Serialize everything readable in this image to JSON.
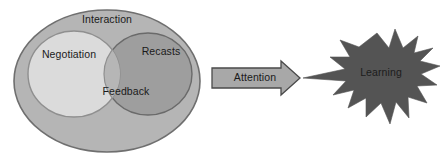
{
  "diagram": {
    "background_color": "#ffffff",
    "outer_set": {
      "label": "Interaction",
      "fill_color": "#b5b5b5",
      "stroke_color": "#6f6f6f"
    },
    "left_set": {
      "label": "Negotiation",
      "fill_color": "#dcdcdc",
      "stroke_color": "#8f8f8f"
    },
    "right_set": {
      "label": "Recasts",
      "fill_color": "#9e9e9e",
      "stroke_color": "#6a6a6a"
    },
    "overlap": {
      "label": "Feedback",
      "fill_color": "#b0b0b0"
    },
    "connector": {
      "label": "Attention",
      "fill_color": "#a8a8a8",
      "stroke_color": "#4a4a4a"
    },
    "outcome": {
      "label": "Learning",
      "fill_color": "#545454",
      "stroke_color": "#545454"
    }
  }
}
